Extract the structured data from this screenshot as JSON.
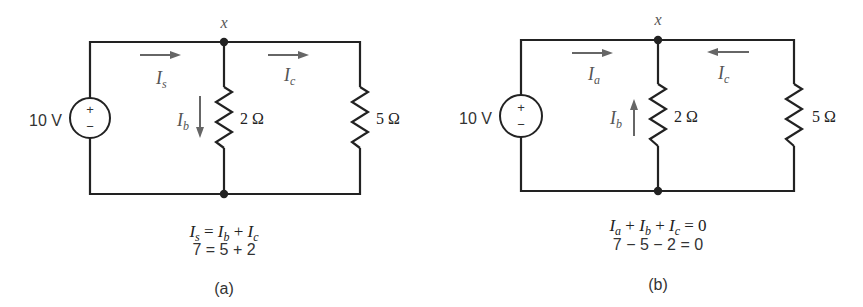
{
  "circuits": [
    {
      "id": "a",
      "caption": "(a)",
      "node_label": "x",
      "source": {
        "label": "10 V",
        "plus": "+",
        "minus": "−"
      },
      "resistors": [
        {
          "label": "2 Ω",
          "value_ohms": 2
        },
        {
          "label": "5 Ω",
          "value_ohms": 5
        }
      ],
      "currents": [
        {
          "name": "I",
          "sub": "s",
          "direction": "right"
        },
        {
          "name": "I",
          "sub": "b",
          "direction": "down"
        },
        {
          "name": "I",
          "sub": "c",
          "direction": "right"
        }
      ],
      "equation_symbolic": {
        "t1": "I",
        "s1": "s",
        "op1": " = ",
        "t2": "I",
        "s2": "b",
        "op2": " + ",
        "t3": "I",
        "s3": "c"
      },
      "equation_numeric": "7 = 5 + 2"
    },
    {
      "id": "b",
      "caption": "(b)",
      "node_label": "x",
      "source": {
        "label": "10 V",
        "plus": "+",
        "minus": "−"
      },
      "resistors": [
        {
          "label": "2 Ω",
          "value_ohms": 2
        },
        {
          "label": "5 Ω",
          "value_ohms": 5
        }
      ],
      "currents": [
        {
          "name": "I",
          "sub": "a",
          "direction": "right"
        },
        {
          "name": "I",
          "sub": "b",
          "direction": "up"
        },
        {
          "name": "I",
          "sub": "c",
          "direction": "left"
        }
      ],
      "equation_symbolic": {
        "t1": "I",
        "s1": "a",
        "op1": " + ",
        "t2": "I",
        "s2": "b",
        "op2": " + ",
        "t3": "I",
        "s3": "c",
        "op3": " = 0"
      },
      "equation_numeric": "7 − 5 − 2 = 0"
    }
  ]
}
